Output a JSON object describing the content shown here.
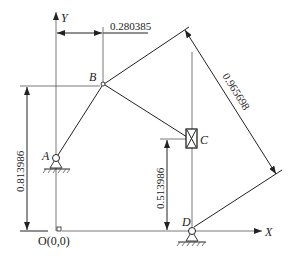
{
  "diagram": {
    "type": "planar-linkage-mechanism",
    "axes": {
      "x_label": "X",
      "y_label": "Y",
      "origin_label": "O(0,0)"
    },
    "points": {
      "A": {
        "label": "A",
        "kind": "fixed-pivot"
      },
      "B": {
        "label": "B",
        "kind": "joint"
      },
      "C": {
        "label": "C",
        "kind": "slider"
      },
      "D": {
        "label": "D",
        "kind": "fixed-pivot"
      }
    },
    "links": [
      {
        "from": "A",
        "to": "B"
      },
      {
        "from": "B",
        "to": "C"
      },
      {
        "from": "B",
        "to": "top-right"
      },
      {
        "from": "D",
        "to": "C",
        "note": "vertical guide"
      }
    ],
    "dimensions": {
      "b_x": "0.280385",
      "b_y": "0.813986",
      "c_y": "0.513986",
      "link_length": "0.965698"
    },
    "colors": {
      "line": "#222222",
      "background": "#ffffff"
    }
  }
}
